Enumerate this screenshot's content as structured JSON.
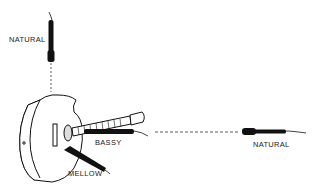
{
  "diagram": {
    "labels": {
      "top_mic": "NATURAL",
      "soundhole_mic": "BASSY",
      "lower_mic": "MELLOW",
      "far_mic": "NATURAL"
    },
    "colors": {
      "ink": "#111111",
      "background": "#ffffff"
    }
  }
}
